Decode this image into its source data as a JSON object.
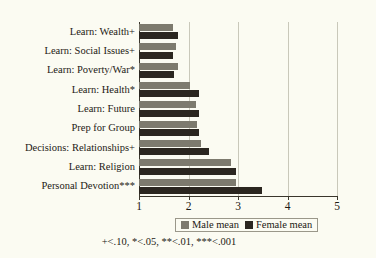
{
  "chart_data": {
    "type": "bar",
    "orientation": "horizontal",
    "title": "",
    "xlabel": "",
    "ylabel": "",
    "xlim": [
      1,
      5
    ],
    "xticks": [
      "1",
      "2",
      "3",
      "4",
      "5"
    ],
    "grid": true,
    "legend_position": "below-axis",
    "categories": [
      "Learn: Wealth+",
      "Learn: Social Issues+",
      "Learn: Poverty/War*",
      "Learn: Health*",
      "Learn: Future",
      "Prep for Group",
      "Decisions: Relationships+",
      "Learn: Religion",
      "Personal Devotion***"
    ],
    "series": [
      {
        "name": "Male mean",
        "color": "#7d7a6e",
        "values": [
          1.68,
          1.75,
          1.79,
          2.04,
          2.15,
          2.18,
          2.25,
          2.85,
          2.95
        ]
      },
      {
        "name": "Female mean",
        "color": "#2b2620",
        "values": [
          1.78,
          1.68,
          1.71,
          2.22,
          2.21,
          2.22,
          2.42,
          2.95,
          3.48
        ]
      }
    ],
    "annotation": "+<.10, *<.05, **<.01, ***<.001"
  },
  "legend": {
    "items": [
      {
        "label": "Male mean"
      },
      {
        "label": "Female mean"
      }
    ]
  },
  "footnote": {
    "text": "+<.10, *<.05, **<.01, ***<.001"
  }
}
